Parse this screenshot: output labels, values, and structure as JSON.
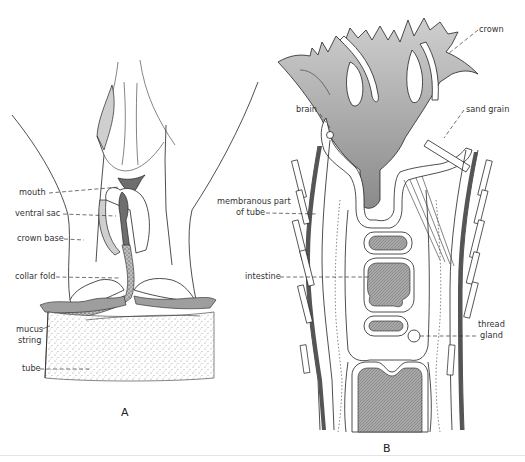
{
  "figure": {
    "panels": [
      {
        "id": "A",
        "label": "A",
        "annotations": [
          {
            "key": "mouth",
            "text": "mouth"
          },
          {
            "key": "ventral_sac",
            "text": "ventral sac"
          },
          {
            "key": "crown_base",
            "text": "crown base"
          },
          {
            "key": "collar_fold",
            "text": "collar fold"
          },
          {
            "key": "mucus_string",
            "text": "mucus string",
            "lines": [
              "mucus",
              "string"
            ]
          },
          {
            "key": "tube",
            "text": "tube"
          }
        ]
      },
      {
        "id": "B",
        "label": "B",
        "annotations": [
          {
            "key": "crown",
            "text": "crown"
          },
          {
            "key": "brain",
            "text": "brain"
          },
          {
            "key": "sand_grain",
            "text": "sand grain"
          },
          {
            "key": "membranous_part_of_tube",
            "text": "membranous part of tube",
            "lines": [
              "membranous part",
              "of tube"
            ]
          },
          {
            "key": "intestine",
            "text": "intestine"
          },
          {
            "key": "thread_gland",
            "text": "thread gland",
            "lines": [
              "thread",
              "gland"
            ]
          }
        ]
      }
    ]
  }
}
